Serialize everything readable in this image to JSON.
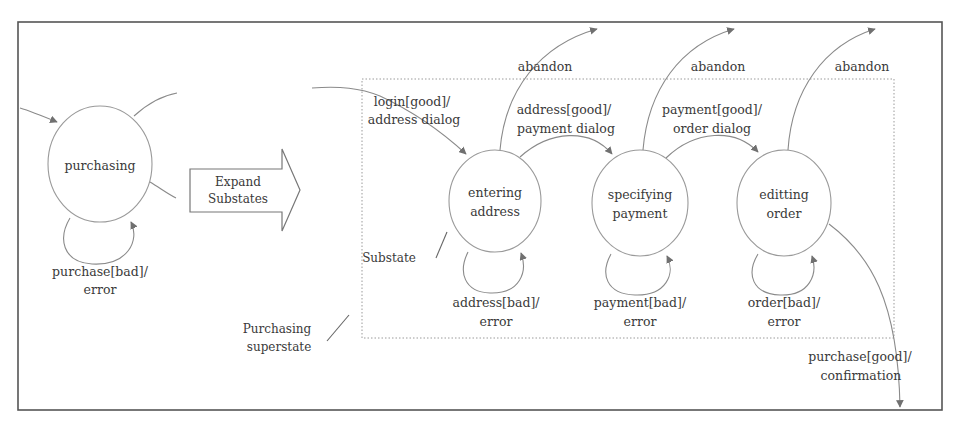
{
  "diagram": {
    "type": "statechart",
    "colors": {
      "line": "#8a8a8a",
      "frame": "#555555",
      "text": "#3a3a3a",
      "dotted": "#9a9a9a"
    },
    "expand_arrow": {
      "line1": "Expand",
      "line2": "Substates"
    },
    "superstate": {
      "label": "purchasing",
      "self_loop": {
        "line1": "purchase[bad]/",
        "line2": "error"
      }
    },
    "substates": [
      {
        "id": "entering_address",
        "line1": "entering",
        "line2": "address",
        "self_loop": {
          "line1": "address[bad]/",
          "line2": "error"
        },
        "abandon": "abandon"
      },
      {
        "id": "specifying_payment",
        "line1": "specifying",
        "line2": "payment",
        "self_loop": {
          "line1": "payment[bad]/",
          "line2": "error"
        },
        "abandon": "abandon"
      },
      {
        "id": "editing_order",
        "line1": "editting",
        "line2": "order",
        "self_loop": {
          "line1": "order[bad]/",
          "line2": "error"
        },
        "abandon": "abandon"
      }
    ],
    "transitions": {
      "login": {
        "line1": "login[good]/",
        "line2": "address dialog"
      },
      "address_good": {
        "line1": "address[good]/",
        "line2": "payment dialog"
      },
      "payment_good": {
        "line1": "payment[good]/",
        "line2": "order dialog"
      },
      "purchase_good": {
        "line1": "purchase[good]/",
        "line2": "confirmation"
      }
    },
    "annotations": {
      "substate": "Substate",
      "superstate_line1": "Purchasing",
      "superstate_line2": "superstate"
    }
  }
}
